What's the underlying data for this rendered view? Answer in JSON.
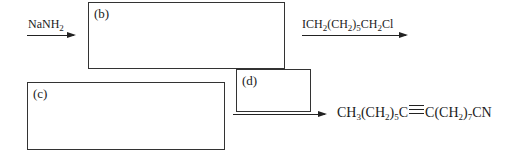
{
  "diagram": {
    "type": "reaction-scheme",
    "steps": [
      {
        "reagent": {
          "parts": [
            "NaNH",
            "2",
            ""
          ]
        },
        "to_box": "b"
      },
      {
        "reagent": {
          "parts": [
            "ICH",
            "2",
            "(CH",
            "2",
            ")",
            "5",
            "CH",
            "2",
            "Cl"
          ]
        },
        "from_box": "b"
      },
      {
        "reagent": {
          "parts": []
        },
        "from_box": "c",
        "via_box": "d"
      }
    ],
    "boxes": {
      "b": {
        "label": "(b)"
      },
      "c": {
        "label": "(c)"
      },
      "d": {
        "label": "(d)"
      }
    },
    "product": {
      "before": [
        "CH",
        "3",
        "(CH",
        "2",
        ")",
        "5",
        "C"
      ],
      "bond": "triple",
      "after": [
        "C(CH",
        "2",
        ")",
        "7",
        "CN"
      ]
    }
  }
}
